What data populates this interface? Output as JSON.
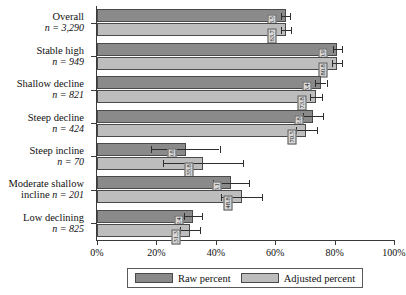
{
  "chart_data": {
    "type": "bar",
    "orientation": "horizontal",
    "title": "",
    "xlabel": "",
    "ylabel": "",
    "xlim": [
      0,
      100
    ],
    "xticks": [
      0,
      20,
      40,
      60,
      80,
      100
    ],
    "xticklabels": [
      "0%",
      "20%",
      "40%",
      "60%",
      "80%",
      "100%"
    ],
    "grid": false,
    "legend_position": "bottom",
    "categories": [
      "Overall",
      "Stable high",
      "Shallow decline",
      "Steep decline",
      "Steep incline",
      "Moderate shallow incline",
      "Low declining"
    ],
    "category_counts": [
      "3,290",
      "949",
      "821",
      "424",
      "70",
      "201",
      "825"
    ],
    "series": [
      {
        "name": "Raw percent",
        "color": "#8a8a8a",
        "values": [
          63.5,
          80.9,
          75.4,
          72.8,
          29.8,
          45.1,
          32.4
        ],
        "err_low": [
          1.5,
          1.5,
          1.9,
          3.4,
          11.5,
          6.1,
          3.1
        ],
        "err_high": [
          1.5,
          1.5,
          1.9,
          3.4,
          11.5,
          6.1,
          3.1
        ]
      },
      {
        "name": "Adjusted percent",
        "color": "#bdbdbd",
        "values": [
          63.7,
          80.8,
          73.8,
          70.5,
          35.8,
          48.8,
          31.3
        ],
        "err_low": [
          1.6,
          1.6,
          2.1,
          3.6,
          13.5,
          6.9,
          3.3
        ],
        "err_high": [
          1.6,
          1.6,
          2.1,
          3.6,
          13.5,
          6.9,
          3.3
        ]
      }
    ],
    "value_labels": {
      "raw": [
        "63.5",
        "80.9",
        "75.4",
        "72.8",
        "29.8",
        "45.1",
        "32.4"
      ],
      "adjusted": [
        "63.7",
        "80.8",
        "73.8",
        "70.5",
        "35.8",
        "48.8",
        "31.3"
      ]
    }
  },
  "legend": {
    "entries": [
      {
        "label": "Raw percent",
        "swatch": "raw"
      },
      {
        "label": "Adjusted percent",
        "swatch": "adjusted"
      }
    ]
  },
  "axis": {
    "n_prefix": "n = "
  }
}
